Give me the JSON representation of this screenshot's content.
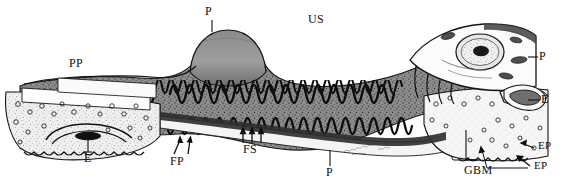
{
  "figure": {
    "background_color": "#ffffff",
    "ink_color": "#101010",
    "width": 571,
    "height": 186,
    "signature": "artist signature (cursive, illegible)"
  },
  "labels": [
    {
      "key": "p-top",
      "text": "P",
      "x": 207,
      "y": 7,
      "leader": "line-down",
      "meaning": "podocyte"
    },
    {
      "key": "us",
      "text": "US",
      "x": 310,
      "y": 15,
      "leader": "none",
      "meaning": "urinary space"
    },
    {
      "key": "pp",
      "text": "PP",
      "x": 70,
      "y": 58,
      "leader": "none",
      "meaning": "primary process"
    },
    {
      "key": "p-right",
      "text": "P",
      "x": 539,
      "y": 51,
      "leader": "line-left",
      "meaning": "podocyte"
    },
    {
      "key": "e-right",
      "text": "E",
      "x": 541,
      "y": 94,
      "leader": "line-left",
      "meaning": "endothelium"
    },
    {
      "key": "e-left",
      "text": "E",
      "x": 100,
      "y": 151,
      "leader": "line-up",
      "meaning": "endothelial cell nucleus"
    },
    {
      "key": "fp",
      "text": "FP",
      "x": 172,
      "y": 155,
      "leader": "arrows-up",
      "meaning": "foot processes"
    },
    {
      "key": "fs",
      "text": "FS",
      "x": 245,
      "y": 145,
      "leader": "arrows-up",
      "meaning": "filtration slits"
    },
    {
      "key": "p-bottom",
      "text": "P",
      "x": 326,
      "y": 165,
      "leader": "line-up",
      "meaning": "podocyte"
    },
    {
      "key": "gbm",
      "text": "GBM",
      "x": 467,
      "y": 165,
      "leader": "line-up",
      "meaning": "glomerular basement membrane"
    },
    {
      "key": "ep-1",
      "text": "EP",
      "x": 535,
      "y": 143,
      "leader": "arrow-left",
      "meaning": "endothelial pore"
    },
    {
      "key": "ep-2",
      "text": "EP",
      "x": 531,
      "y": 162,
      "leader": "arrow-left",
      "meaning": "endothelial pore"
    }
  ],
  "structures": [
    {
      "name": "podocyte-cell-body-center",
      "description": "central domed podocyte cell body"
    },
    {
      "name": "podocyte-cell-body-right",
      "description": "right podocyte with nucleus and nucleolus"
    },
    {
      "name": "primary-process",
      "description": "tapering primary process on the left"
    },
    {
      "name": "foot-processes",
      "description": "interdigitating serpentine foot processes"
    },
    {
      "name": "glomerular-basement-membrane",
      "description": "pale band beneath foot processes"
    },
    {
      "name": "fenestrated-endothelium",
      "description": "stippled endothelial lining with circular pores"
    },
    {
      "name": "endothelial-nucleus",
      "description": "lens shaped nucleus in left endothelium"
    },
    {
      "name": "urinary-space",
      "description": "white space above the capillary"
    }
  ]
}
